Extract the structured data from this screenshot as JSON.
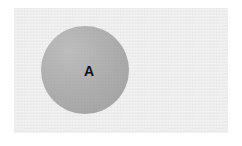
{
  "figure": {
    "type": "labeled-circle-diagram",
    "canvas": {
      "width": 242,
      "height": 146,
      "background_color": "#ffffff"
    },
    "backdrop": {
      "name": "image-panel",
      "fill_color": "#ededed",
      "x": 14,
      "y": 8,
      "width": 214,
      "height": 125,
      "texture": "fine-grain"
    },
    "shapes": [
      {
        "id": "circle-a",
        "kind": "circle",
        "label": "A",
        "label_color": "#111111",
        "fill_color": "#ababab",
        "center_x": 85,
        "center_y": 70,
        "diameter": 88,
        "radius": 44,
        "shading": "soft top-left highlight, bottom-right falloff"
      }
    ]
  }
}
